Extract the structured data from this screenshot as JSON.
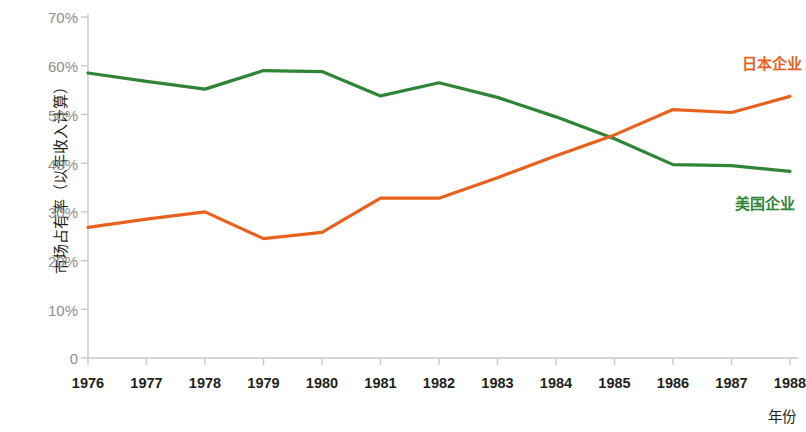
{
  "chart_data": {
    "type": "line",
    "title": "",
    "xlabel": "年份",
    "ylabel": "市场占有率（以年收入计算）",
    "x": [
      1976,
      1977,
      1978,
      1979,
      1980,
      1981,
      1982,
      1983,
      1984,
      1985,
      1986,
      1987,
      1988
    ],
    "categories": [
      "1976",
      "1977",
      "1978",
      "1979",
      "1980",
      "1981",
      "1982",
      "1983",
      "1984",
      "1985",
      "1986",
      "1987",
      "1988"
    ],
    "xlim": [
      1976,
      1988
    ],
    "ylim": [
      0,
      70
    ],
    "yticks": [
      0,
      10,
      20,
      30,
      40,
      50,
      60,
      70
    ],
    "ytick_labels": [
      "0",
      "10%",
      "20%",
      "30%",
      "40%",
      "50%",
      "60%",
      "70%"
    ],
    "grid": false,
    "legend_position": "right-inline",
    "series": [
      {
        "name": "日本企业",
        "color": "#e8621e",
        "values": [
          26.8,
          28.5,
          30.0,
          24.5,
          25.8,
          32.8,
          32.8,
          37.0,
          41.5,
          45.8,
          51.0,
          50.4,
          53.7
        ]
      },
      {
        "name": "美国企业",
        "color": "#2f8435",
        "values": [
          58.5,
          56.8,
          55.2,
          59.0,
          58.8,
          53.8,
          56.5,
          53.5,
          49.5,
          45.0,
          39.7,
          39.5,
          38.3
        ]
      }
    ],
    "annotations": []
  },
  "axes": {
    "y_title": "市场占有率（以年收入计算）",
    "x_title": "年份",
    "y_labels": [
      "70%",
      "60%",
      "50%",
      "40%",
      "30%",
      "20%",
      "10%",
      "0"
    ],
    "x_labels": [
      "1976",
      "1977",
      "1978",
      "1979",
      "1980",
      "1981",
      "1982",
      "1983",
      "1984",
      "1985",
      "1986",
      "1987",
      "1988"
    ],
    "axis_color": "#c9c9c9",
    "tick_text_color": "#8d8d8d",
    "x_tick_text_color": "#231f20"
  },
  "legend": {
    "japan": "日本企业",
    "usa": "美国企业",
    "japan_color": "#e8621e",
    "usa_color": "#2f8435"
  }
}
